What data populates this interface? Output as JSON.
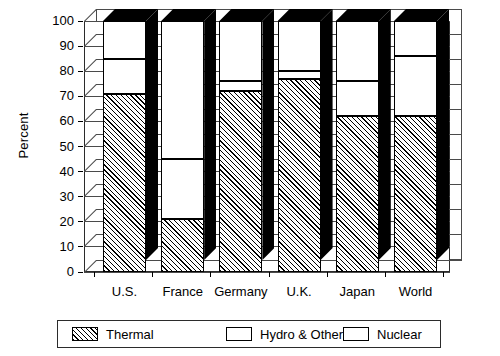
{
  "chart_data": {
    "type": "bar",
    "stacked": true,
    "title": "",
    "xlabel": "",
    "ylabel": "Percent",
    "ylim": [
      0,
      100
    ],
    "ytick_step": 10,
    "yticks": [
      "0",
      "10",
      "20",
      "30",
      "40",
      "50",
      "60",
      "70",
      "80",
      "90",
      "100"
    ],
    "grid": true,
    "legend_position": "bottom",
    "categories": [
      "U.S.",
      "France",
      "Germany",
      "U.K.",
      "Japan",
      "World"
    ],
    "series": [
      {
        "name": "Thermal",
        "pattern": "diagonal-hatch",
        "values": [
          71,
          21,
          72,
          77,
          62,
          62
        ]
      },
      {
        "name": "Hydro & Other",
        "pattern": "solid-white",
        "values": [
          14,
          24,
          4,
          3,
          14,
          24
        ]
      },
      {
        "name": "Nuclear",
        "pattern": "checkerboard",
        "values": [
          15,
          55,
          24,
          20,
          24,
          14
        ]
      }
    ],
    "cumulative_tops": {
      "Thermal": [
        71,
        21,
        72,
        77,
        62,
        62
      ],
      "Hydro & Other": [
        85,
        45,
        76,
        80,
        76,
        86
      ],
      "Nuclear": [
        100,
        100,
        100,
        100,
        100,
        100
      ]
    }
  },
  "legend": {
    "items": [
      {
        "label": "Thermal",
        "swatch": "thermal-hatch-swatch"
      },
      {
        "label": "Hydro & Other",
        "swatch": "hydro-white-swatch"
      },
      {
        "label": "Nuclear",
        "swatch": "nuclear-checker-swatch"
      }
    ]
  },
  "colors": {
    "ink": "#000000",
    "axis": "#2b2b2b",
    "grid": "#4a4a4a",
    "fill_white": "#ffffff",
    "side_face": "#000000"
  }
}
